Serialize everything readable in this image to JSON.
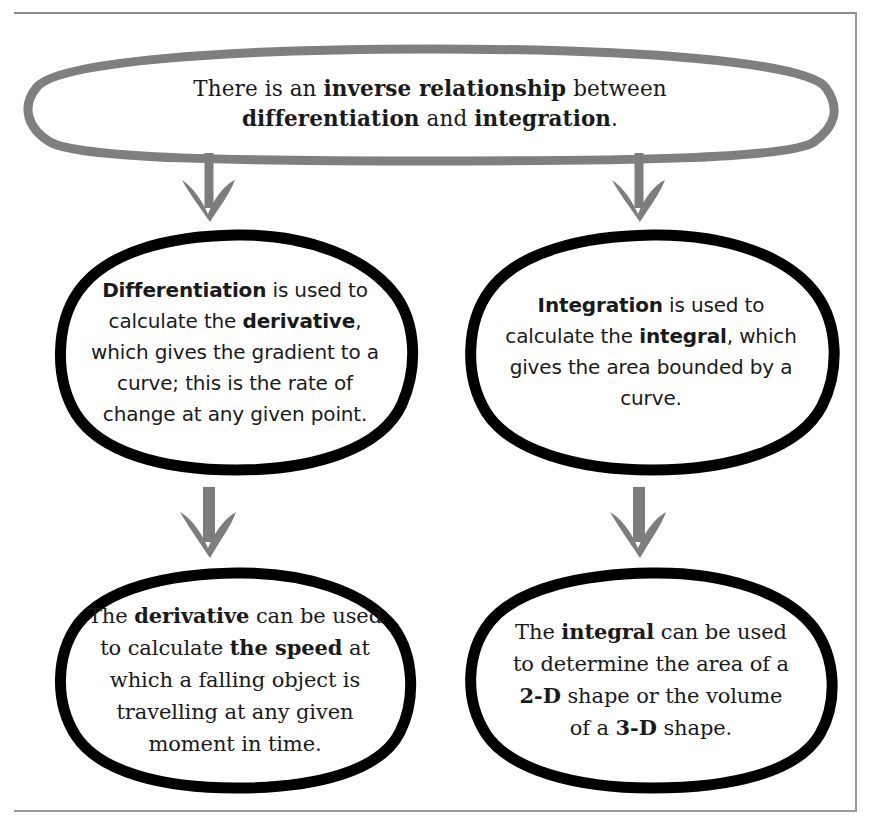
{
  "page": {
    "title": "There is an inverse relationship between differentiation and integration.",
    "background_color": "#ffffff",
    "rule_color": "#9a9a9a"
  },
  "colors": {
    "banner_outline": "#7f7f7f",
    "node_outline": "#000000",
    "arrow": "#7d7d7d",
    "text": "#1a1a1a"
  },
  "nodes": {
    "top": {
      "id": "inverse-relationship",
      "outline_color": "#7f7f7f",
      "line1_plain_a": "There is an ",
      "line1_bold": "inverse relationship",
      "line1_plain_b": " between",
      "line2_bold_a": "differentiation",
      "line2_plain": " and ",
      "line2_bold_b": "integration",
      "line2_end": ".",
      "plain_text": "There is an inverse relationship between differentiation and integration."
    },
    "differentiation": {
      "id": "differentiation",
      "outline_color": "#000000",
      "bold_a": "Differentiation",
      "plain_a": " is used to calculate the ",
      "bold_b": "derivative",
      "plain_b": ", which gives the gradient to a curve; this is the rate of change at any given point.",
      "plain_text": "Differentiation is used to calculate the derivative, which gives the gradient to a curve; this is the rate of change at any given point."
    },
    "integration": {
      "id": "integration",
      "outline_color": "#000000",
      "bold_a": "Integration",
      "plain_a": " is used to calculate the ",
      "bold_b": "integral",
      "plain_b": ", which gives the area bounded by a curve.",
      "plain_text": "Integration is used to calculate the integral, which gives the area bounded by a curve."
    },
    "speed": {
      "id": "derivative-speed",
      "outline_color": "#000000",
      "plain_a": "The ",
      "bold_a": "derivative",
      "plain_b": " can be used to calculate ",
      "bold_b": "the speed",
      "plain_c": " at which a falling object is travelling at any given moment in time.",
      "plain_text": "The derivative can be used to calculate the speed at which a falling object is travelling at any given moment in time."
    },
    "volume": {
      "id": "integral-area-volume",
      "outline_color": "#000000",
      "plain_a": "The ",
      "bold_a": "integral",
      "plain_b": " can be used to determine the area of a ",
      "bold_b": "2-D",
      "plain_c": " shape or the volume of a ",
      "bold_c": "3-D",
      "plain_d": " shape.",
      "plain_text": "The integral can be used to determine the area of a 2-D shape or the volume of a 3-D shape."
    }
  },
  "arrows": [
    {
      "id": "arrow-top-to-differentiation",
      "from": "inverse-relationship",
      "to": "differentiation",
      "color": "#7d7d7d",
      "direction": "down"
    },
    {
      "id": "arrow-top-to-integration",
      "from": "inverse-relationship",
      "to": "integration",
      "color": "#7d7d7d",
      "direction": "down"
    },
    {
      "id": "arrow-differentiation-to-speed",
      "from": "differentiation",
      "to": "derivative-speed",
      "color": "#7d7d7d",
      "direction": "down"
    },
    {
      "id": "arrow-integration-to-volume",
      "from": "integration",
      "to": "integral-area-volume",
      "color": "#7d7d7d",
      "direction": "down"
    }
  ]
}
